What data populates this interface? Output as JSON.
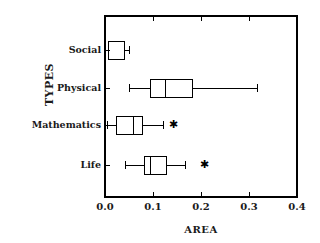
{
  "chart_data": {
    "type": "boxplot",
    "title": "",
    "xlabel": "AREA",
    "ylabel": "TYPES",
    "orientation": "horizontal",
    "xlim": [
      0.0,
      0.4
    ],
    "grid": false,
    "legend": "none",
    "xticks": [
      "0.0",
      "0.1",
      "0.2",
      "0.3",
      "0.4"
    ],
    "xtick_values": [
      0.0,
      0.1,
      0.2,
      0.3,
      0.4
    ],
    "categories": [
      "Social",
      "Physical",
      "Mathematics",
      "Life"
    ],
    "boxes": [
      {
        "category": "Social",
        "whisker_low": 0.0,
        "q1": 0.008,
        "median": 0.008,
        "q3": 0.04,
        "whisker_high": 0.052,
        "outliers": []
      },
      {
        "category": "Physical",
        "whisker_low": 0.052,
        "q1": 0.094,
        "median": 0.125,
        "q3": 0.183,
        "whisker_high": 0.317,
        "outliers": []
      },
      {
        "category": "Mathematics",
        "whisker_low": 0.006,
        "q1": 0.023,
        "median": 0.06,
        "q3": 0.079,
        "whisker_high": 0.121,
        "outliers": [
          0.142
        ]
      },
      {
        "category": "Life",
        "whisker_low": 0.042,
        "q1": 0.083,
        "median": 0.094,
        "q3": 0.129,
        "whisker_high": 0.167,
        "outliers": [
          0.208
        ]
      }
    ],
    "colors": {
      "frame": "#000000",
      "box": "#000000",
      "whisker": "#000000",
      "outlier": "#000000",
      "background": "#ffffff"
    }
  },
  "plot_geometry": {
    "left": 105,
    "right": 297,
    "top": 16,
    "bottom": 197,
    "row_y": [
      50,
      88,
      125,
      165
    ],
    "tick_len": 5,
    "box_half_height": 9,
    "cap_half_height": 4
  }
}
